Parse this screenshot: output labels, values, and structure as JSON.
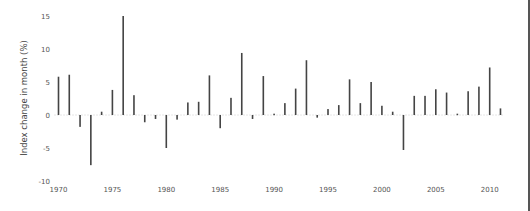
{
  "chart_data": {
    "type": "bar",
    "title": "",
    "xlabel": "",
    "ylabel": "Index change in month (%)",
    "ylim": [
      -10,
      15
    ],
    "xlim": [
      1970,
      2011
    ],
    "grid": false,
    "zero_line": "dotted",
    "bar_color": "#444444",
    "yticks": [
      -10,
      -5,
      0,
      5,
      10,
      15
    ],
    "ytick_labels": [
      "-10",
      "-5",
      "0",
      "5",
      "10",
      "15"
    ],
    "xticks": [
      1970,
      1975,
      1980,
      1985,
      1990,
      1995,
      2000,
      2005,
      2010
    ],
    "xtick_labels": [
      "1970",
      "1975",
      "1980",
      "1985",
      "1990",
      "1995",
      "2000",
      "2005",
      "2010"
    ],
    "categories": [
      1970,
      1971,
      1972,
      1973,
      1974,
      1975,
      1976,
      1977,
      1978,
      1979,
      1980,
      1981,
      1982,
      1983,
      1984,
      1985,
      1986,
      1987,
      1988,
      1989,
      1990,
      1991,
      1992,
      1993,
      1994,
      1995,
      1996,
      1997,
      1998,
      1999,
      2000,
      2001,
      2002,
      2003,
      2004,
      2005,
      2006,
      2007,
      2008,
      2009,
      2010,
      2011
    ],
    "values": [
      5.8,
      6.1,
      -1.8,
      -7.6,
      0.5,
      3.8,
      15.0,
      3.0,
      -1.1,
      -0.6,
      -5.0,
      -0.7,
      1.9,
      2.0,
      6.0,
      -2.0,
      2.6,
      9.4,
      -0.6,
      5.9,
      0.2,
      1.8,
      4.0,
      8.3,
      -0.4,
      0.9,
      1.5,
      5.4,
      1.8,
      5.0,
      1.4,
      0.5,
      -5.3,
      2.9,
      2.9,
      3.9,
      3.4,
      0.2,
      3.6,
      4.3,
      7.2,
      1.0
    ]
  }
}
